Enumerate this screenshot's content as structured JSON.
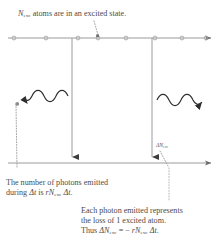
{
  "figure": {
    "width": 221,
    "height": 251,
    "background": "#ffffff",
    "ink_color": "#4a4a4a",
    "line_color": "#8a8a8a"
  },
  "captions": {
    "top": {
      "symbol": "N",
      "symbol_sub": "exc",
      "text": " atoms are in an excited state."
    },
    "lower_left": {
      "line1": "The number of photons emitted",
      "line2_pre": "during ",
      "line2_dt": "Δt",
      "line2_mid": " is ",
      "line2_r": "r",
      "line2_N": "N",
      "line2_sub": "exc",
      "line2_dt2": " Δt",
      "line2_end": "."
    },
    "lower_right": {
      "line1": "Each photon emitted represents",
      "line2": "the loss of 1 excited atom.",
      "line3_pre": "Thus ",
      "line3_dN": "ΔN",
      "line3_sub1": "exc",
      "line3_eq": " = − ",
      "line3_r": "r",
      "line3_N": "N",
      "line3_sub2": "exc",
      "line3_dt": " Δt",
      "line3_end": "."
    }
  },
  "annotation": {
    "delta_n_label": "ΔN",
    "delta_n_sub": "exc"
  },
  "axes": {
    "top_line": {
      "y": 38,
      "x1": 8,
      "x2": 213,
      "arrow": "right"
    },
    "bottom_line": {
      "y": 163,
      "x1": 8,
      "x2": 213,
      "arrow": "right"
    },
    "tick_dots_x": [
      14,
      46,
      78,
      98,
      126,
      155,
      182,
      208
    ],
    "tick_marker": "small-circle"
  },
  "decay_lines": [
    {
      "name": "atom-decay-left",
      "x": 72,
      "y_top": 38,
      "y_bottom": 163
    },
    {
      "name": "atom-decay-right",
      "x": 152,
      "y_top": 38,
      "y_bottom": 163
    }
  ],
  "photons": [
    {
      "name": "photon-left",
      "direction": "left",
      "x_start": 68,
      "x_end": 14,
      "y": 96
    },
    {
      "name": "photon-right",
      "direction": "right",
      "x_start": 158,
      "x_end": 212,
      "y": 100
    }
  ],
  "leaders": [
    {
      "name": "leader-top-caption",
      "from_x": 96,
      "from_y": 22,
      "to_x": 98,
      "to_y": 36
    },
    {
      "name": "leader-photon-left",
      "from_x": 16,
      "from_y": 160,
      "to_x": 15,
      "to_y": 100
    },
    {
      "name": "leader-delta-n",
      "from_x": 168,
      "from_y": 185,
      "to_x": 160,
      "to_y": 150
    }
  ]
}
